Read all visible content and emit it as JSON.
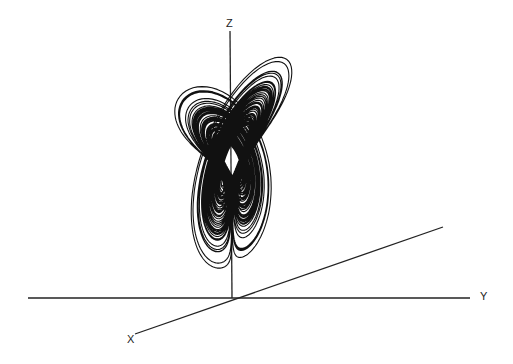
{
  "figure": {
    "background": "#ffffff",
    "ink_color": "#111111"
  },
  "axes": {
    "x": {
      "label": "X",
      "start": [
        135,
        334
      ],
      "end": [
        443,
        227
      ],
      "label_pos": [
        127,
        334
      ]
    },
    "y": {
      "label": "Y",
      "start": [
        28,
        298
      ],
      "end": [
        470,
        298
      ],
      "label_pos": [
        480,
        291
      ]
    },
    "z": {
      "label": "Z",
      "start": [
        230,
        31
      ],
      "end": [
        232,
        298
      ],
      "label_pos": [
        226,
        18
      ]
    },
    "origin": [
      232,
      298
    ]
  },
  "attractor": {
    "system": "Lorenz",
    "sigma": 10,
    "rho": 28,
    "beta": 2.6667,
    "dt": 0.005,
    "steps": 16000,
    "initial": [
      1,
      1,
      20
    ],
    "projection": {
      "ox": 232,
      "oy": 298,
      "xx": -4.2,
      "xy": 1.35,
      "yx": 7.4,
      "yy": -2.3,
      "zx": 0.0,
      "zy": -4.6,
      "y_shift": -15
    },
    "stroke_width": 1.1
  }
}
